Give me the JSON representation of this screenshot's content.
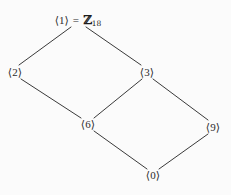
{
  "figure": {
    "name": "subgroup-lattice-of-Z18",
    "background_color": "#fbfbfb",
    "edge_color": "#3a3a3a",
    "text_color": "#2b2b2b",
    "width": 231,
    "height": 195
  },
  "top_node": {
    "generator_label": "⟨1⟩",
    "equals": "=",
    "group_symbol": "ℤ",
    "group_subscript": "18",
    "full_text": "⟨1⟩ = ℤ18"
  },
  "nodes": [
    {
      "id": "n1",
      "label": "⟨1⟩",
      "x": 78,
      "y": 20
    },
    {
      "id": "n2",
      "label": "⟨2⟩",
      "x": 15,
      "y": 72
    },
    {
      "id": "n3",
      "label": "⟨3⟩",
      "x": 147,
      "y": 72
    },
    {
      "id": "n6",
      "label": "⟨6⟩",
      "x": 88,
      "y": 124
    },
    {
      "id": "n9",
      "label": "⟨9⟩",
      "x": 213,
      "y": 127
    },
    {
      "id": "n0",
      "label": "⟨0⟩",
      "x": 153,
      "y": 175
    }
  ],
  "edges": [
    {
      "from": "n1",
      "to": "n2",
      "x1": 71,
      "y1": 27,
      "x2": 19,
      "y2": 65
    },
    {
      "from": "n1",
      "to": "n3",
      "x1": 86,
      "y1": 27,
      "x2": 141,
      "y2": 65
    },
    {
      "from": "n2",
      "to": "n6",
      "x1": 21,
      "y1": 79,
      "x2": 81,
      "y2": 118
    },
    {
      "from": "n3",
      "to": "n6",
      "x1": 142,
      "y1": 79,
      "x2": 94,
      "y2": 118
    },
    {
      "from": "n3",
      "to": "n9",
      "x1": 153,
      "y1": 79,
      "x2": 208,
      "y2": 120
    },
    {
      "from": "n6",
      "to": "n0",
      "x1": 94,
      "y1": 131,
      "x2": 147,
      "y2": 169
    },
    {
      "from": "n9",
      "to": "n0",
      "x1": 208,
      "y1": 134,
      "x2": 159,
      "y2": 169
    }
  ]
}
